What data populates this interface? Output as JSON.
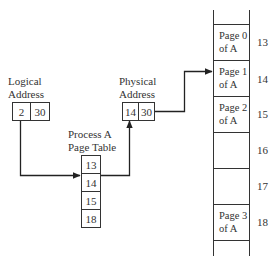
{
  "logical_address": {
    "label_line1": "Logical",
    "label_line2": "Address",
    "page": "2",
    "offset": "30"
  },
  "page_table": {
    "label_line1": "Process A",
    "label_line2": "Page Table",
    "entries": [
      "13",
      "14",
      "15",
      "18"
    ],
    "highlighted_index": 1
  },
  "physical_address": {
    "label_line1": "Physical",
    "label_line2": "Address",
    "frame": "14",
    "offset": "30"
  },
  "memory": {
    "frames": [
      {
        "number": "13",
        "line1": "Page 0",
        "line2": "of A"
      },
      {
        "number": "14",
        "line1": "Page 1",
        "line2": "of A"
      },
      {
        "number": "15",
        "line1": "Page 2",
        "line2": "of A"
      },
      {
        "number": "16",
        "line1": "",
        "line2": ""
      },
      {
        "number": "17",
        "line1": "",
        "line2": ""
      },
      {
        "number": "18",
        "line1": "Page 3",
        "line2": "of A"
      }
    ]
  }
}
